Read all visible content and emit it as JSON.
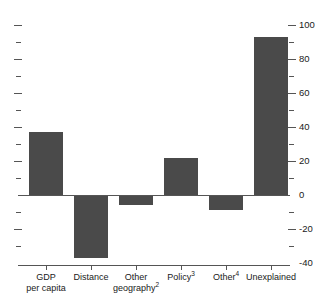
{
  "chart_data": {
    "type": "bar",
    "title": "",
    "subtitle": "",
    "xlabel": "",
    "ylabel": "",
    "categories": [
      "GDP per capita",
      "Distance",
      "Other geography²",
      "Policy³",
      "Other⁴",
      "Unexplained"
    ],
    "values": [
      37,
      -37,
      -6,
      22,
      -9,
      93
    ],
    "ylim": [
      -40,
      100
    ],
    "ytick_labels": [
      "100",
      "80",
      "60",
      "40",
      "20",
      "0",
      "-20",
      "-40"
    ],
    "ytick_values": [
      100,
      80,
      60,
      40,
      20,
      0,
      -20,
      -40
    ],
    "yminor_values": [
      90,
      70,
      50,
      30,
      10,
      -10,
      -30
    ],
    "grid": false,
    "legend": "none",
    "axis_position": "right",
    "bar_color": "#4a4a4a",
    "axis_color": "#555555"
  },
  "axis": {
    "labels": [
      {
        "text": "100",
        "value": 100
      },
      {
        "text": "80",
        "value": 80
      },
      {
        "text": "60",
        "value": 60
      },
      {
        "text": "40",
        "value": 40
      },
      {
        "text": "20",
        "value": 20
      },
      {
        "text": "0",
        "value": 0
      },
      {
        "text": "-20",
        "value": -20
      },
      {
        "text": "-40",
        "value": -40
      }
    ]
  },
  "categories": [
    {
      "line1": "GDP",
      "line2": "per capita",
      "sup": "",
      "sup2": ""
    },
    {
      "line1": "Distance",
      "line2": "",
      "sup": "",
      "sup2": ""
    },
    {
      "line1": "Other",
      "line2": "geography",
      "sup": "",
      "sup2": "2"
    },
    {
      "line1": "Policy",
      "line2": "",
      "sup": "3",
      "sup2": ""
    },
    {
      "line1": "Other",
      "line2": "",
      "sup": "4",
      "sup2": ""
    },
    {
      "line1": "Unexplained",
      "line2": "",
      "sup": "",
      "sup2": ""
    }
  ]
}
